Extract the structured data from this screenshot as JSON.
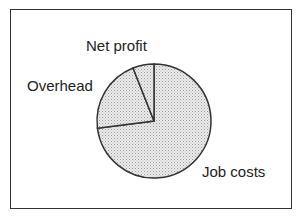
{
  "chart_data": {
    "type": "pie",
    "title": "",
    "categories": [
      "Job costs",
      "Overhead",
      "Net profit"
    ],
    "values": [
      73,
      21,
      6
    ],
    "units": "percent (estimated from slice angles)",
    "start_angle_deg": 0,
    "direction": "clockwise from 12 o'clock: Job costs, Overhead, Net profit",
    "legend": "none (direct labels)",
    "fill": "light gray stippled"
  },
  "labels": {
    "net_profit": "Net profit",
    "overhead": "Overhead",
    "job_costs": "Job costs"
  },
  "colors": {
    "fill": "#e6e6e6",
    "stipple": "#9a9a9a",
    "stroke": "#333333"
  }
}
